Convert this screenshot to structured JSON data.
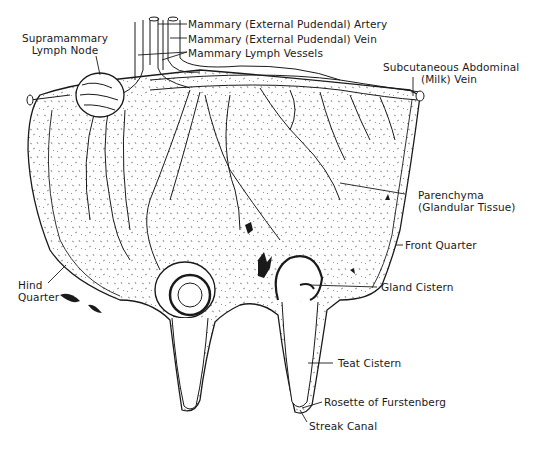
{
  "diagram": {
    "colors": {
      "ink": "#1a1a1a",
      "paper": "#ffffff",
      "stipple": "#555555"
    },
    "labels": {
      "supramammary_line1": "Supramammary",
      "supramammary_line2": "Lymph Node",
      "artery": "Mammary (External Pudendal) Artery",
      "vein": "Mammary (External Pudendal) Vein",
      "lymph_vessels": "Mammary Lymph Vessels",
      "milk_vein_line1": "Subcutaneous Abdominal",
      "milk_vein_line2": "(Milk) Vein",
      "parenchyma_line1": "Parenchyma",
      "parenchyma_line2": "(Glandular Tissue)",
      "front_quarter": "Front Quarter",
      "hind_line1": "Hind",
      "hind_line2": "Quarter",
      "gland_cistern": "Gland Cistern",
      "teat_cistern": "Teat Cistern",
      "rosette": "Rosette of Furstenberg",
      "streak_canal": "Streak Canal"
    }
  }
}
